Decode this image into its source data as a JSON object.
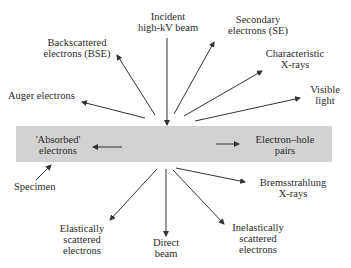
{
  "diagram": {
    "specimen_label": "Specimen",
    "incident": {
      "line1": "Incident",
      "line2": "high-kV beam"
    },
    "signals_above": [
      {
        "id": "bse",
        "line1": "Backscattered",
        "line2": "electrons (BSE)"
      },
      {
        "id": "se",
        "line1": "Secondary",
        "line2": "electrons (SE)"
      },
      {
        "id": "auger",
        "line1": "Auger electrons",
        "line2": ""
      },
      {
        "id": "xray",
        "line1": "Characteristic",
        "line2": "X-rays"
      },
      {
        "id": "light",
        "line1": "Visible",
        "line2": "light"
      }
    ],
    "signals_within": [
      {
        "id": "absorbed",
        "line1": "'Absorbed'",
        "line2": "electrons"
      },
      {
        "id": "eh",
        "line1": "Electron–hole",
        "line2": "pairs"
      }
    ],
    "signals_below": [
      {
        "id": "brems",
        "line1": "Bremsstrahlung",
        "line2": "X-rays"
      },
      {
        "id": "elastic",
        "line1": "Elastically",
        "line2": "scattered",
        "line3": "electrons"
      },
      {
        "id": "direct",
        "line1": "Direct",
        "line2": "beam"
      },
      {
        "id": "inelastic",
        "line1": "Inelastically",
        "line2": "scattered",
        "line3": "electrons"
      }
    ],
    "colors": {
      "specimen": "#d2d2d2",
      "arrow": "#333333",
      "text": "#2a2a2a"
    }
  }
}
